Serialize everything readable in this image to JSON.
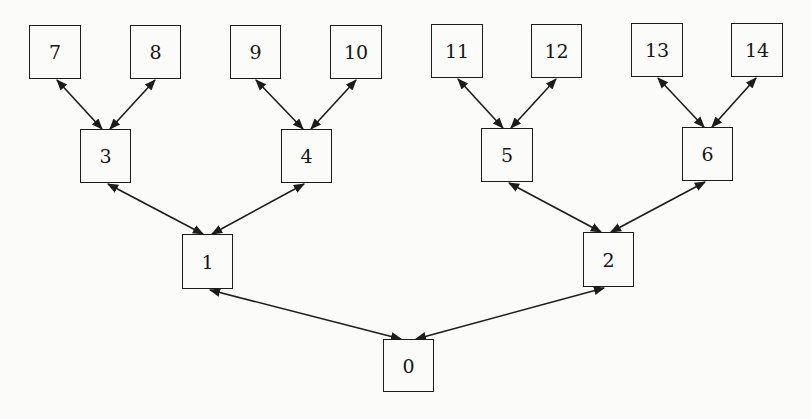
{
  "diagram": {
    "type": "binary-tree",
    "edge_style": "bidirectional-arrow",
    "colors": {
      "stroke": "#1c1c1c",
      "background": "#fbfbfa",
      "text": "#151515"
    },
    "nodes": [
      {
        "id": "0",
        "label": "0",
        "x": 383,
        "y": 339,
        "w": 51,
        "h": 53
      },
      {
        "id": "1",
        "label": "1",
        "x": 182,
        "y": 234,
        "w": 51,
        "h": 55
      },
      {
        "id": "2",
        "label": "2",
        "x": 583,
        "y": 232,
        "w": 51,
        "h": 55
      },
      {
        "id": "3",
        "label": "3",
        "x": 80,
        "y": 129,
        "w": 51,
        "h": 54
      },
      {
        "id": "4",
        "label": "4",
        "x": 281,
        "y": 129,
        "w": 51,
        "h": 54
      },
      {
        "id": "5",
        "label": "5",
        "x": 481,
        "y": 128,
        "w": 52,
        "h": 54
      },
      {
        "id": "6",
        "label": "6",
        "x": 682,
        "y": 127,
        "w": 51,
        "h": 54
      },
      {
        "id": "7",
        "label": "7",
        "x": 29,
        "y": 25,
        "w": 52,
        "h": 54
      },
      {
        "id": "8",
        "label": "8",
        "x": 130,
        "y": 25,
        "w": 51,
        "h": 54
      },
      {
        "id": "9",
        "label": "9",
        "x": 230,
        "y": 25,
        "w": 51,
        "h": 54
      },
      {
        "id": "10",
        "label": "10",
        "x": 330,
        "y": 25,
        "w": 52,
        "h": 54
      },
      {
        "id": "11",
        "label": "11",
        "x": 431,
        "y": 24,
        "w": 52,
        "h": 54
      },
      {
        "id": "12",
        "label": "12",
        "x": 531,
        "y": 24,
        "w": 51,
        "h": 54
      },
      {
        "id": "13",
        "label": "13",
        "x": 631,
        "y": 23,
        "w": 52,
        "h": 54
      },
      {
        "id": "14",
        "label": "14",
        "x": 731,
        "y": 23,
        "w": 52,
        "h": 54
      }
    ],
    "edges": [
      {
        "from": "0",
        "to": "1",
        "x1": 401,
        "y1": 339,
        "x2": 210,
        "y2": 290
      },
      {
        "from": "0",
        "to": "2",
        "x1": 416,
        "y1": 339,
        "x2": 604,
        "y2": 288
      },
      {
        "from": "1",
        "to": "3",
        "x1": 203,
        "y1": 234,
        "x2": 108,
        "y2": 184
      },
      {
        "from": "1",
        "to": "4",
        "x1": 212,
        "y1": 234,
        "x2": 304,
        "y2": 184
      },
      {
        "from": "2",
        "to": "5",
        "x1": 601,
        "y1": 232,
        "x2": 509,
        "y2": 183
      },
      {
        "from": "2",
        "to": "6",
        "x1": 611,
        "y1": 232,
        "x2": 705,
        "y2": 182
      },
      {
        "from": "3",
        "to": "7",
        "x1": 102,
        "y1": 129,
        "x2": 57,
        "y2": 80
      },
      {
        "from": "3",
        "to": "8",
        "x1": 110,
        "y1": 129,
        "x2": 155,
        "y2": 80
      },
      {
        "from": "4",
        "to": "9",
        "x1": 303,
        "y1": 129,
        "x2": 256,
        "y2": 80
      },
      {
        "from": "4",
        "to": "10",
        "x1": 311,
        "y1": 129,
        "x2": 356,
        "y2": 80
      },
      {
        "from": "5",
        "to": "11",
        "x1": 503,
        "y1": 128,
        "x2": 458,
        "y2": 79
      },
      {
        "from": "5",
        "to": "12",
        "x1": 511,
        "y1": 128,
        "x2": 556,
        "y2": 79
      },
      {
        "from": "6",
        "to": "13",
        "x1": 704,
        "y1": 127,
        "x2": 658,
        "y2": 78
      },
      {
        "from": "6",
        "to": "14",
        "x1": 712,
        "y1": 127,
        "x2": 756,
        "y2": 78
      }
    ]
  }
}
